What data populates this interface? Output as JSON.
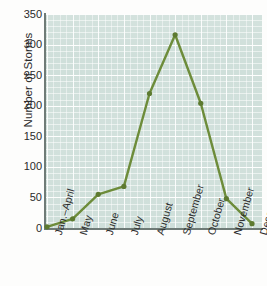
{
  "chart_data": {
    "type": "line",
    "title": "",
    "xlabel": "",
    "ylabel": "Number of Storms",
    "categories": [
      "Jan.–April",
      "May",
      "June",
      "July",
      "August",
      "September",
      "October",
      "November",
      "December"
    ],
    "values": [
      2,
      15,
      55,
      68,
      220,
      316,
      204,
      48,
      7
    ],
    "series": [
      {
        "name": "Number of Storms",
        "values": [
          2,
          15,
          55,
          68,
          220,
          316,
          204,
          48,
          7
        ]
      }
    ],
    "ylim": [
      0,
      350
    ],
    "yticks": [
      0,
      50,
      100,
      150,
      200,
      250,
      300,
      350
    ],
    "ytick_labels": [
      "0",
      "50",
      "100",
      "150",
      "200",
      "250",
      "300",
      "350"
    ],
    "grid": true,
    "legend": false,
    "legend_position": "none",
    "colors": {
      "line": "#6d8c3a",
      "marker": "#5d7a30",
      "plot_background": "#cfdfda",
      "gridline": "#ffffff",
      "axis": "#6f7b77",
      "text": "#2b2b2b",
      "page_background": "#fdfdfc"
    }
  }
}
